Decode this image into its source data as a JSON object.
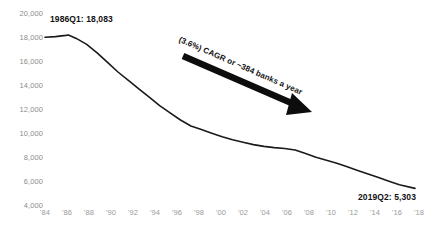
{
  "chart_data": {
    "type": "line",
    "title": "",
    "subtitle": "",
    "xlabel": "",
    "ylabel": "",
    "grid": false,
    "legend": "none",
    "ylim": [
      4000,
      20000
    ],
    "ytick_labels": [
      "20,000",
      "18,000",
      "16,000",
      "14,000",
      "12,000",
      "10,000",
      "8,000",
      "6,000",
      "4,000"
    ],
    "ytick_values": [
      20000,
      18000,
      16000,
      14000,
      12000,
      10000,
      8000,
      6000,
      4000
    ],
    "xlim": [
      1984,
      2019.5
    ],
    "xtick_labels": [
      "'84",
      "'86",
      "'88",
      "'90",
      "'92",
      "'94",
      "'96",
      "'98",
      "'00",
      "'02",
      "'04",
      "'06",
      "'08",
      "'10",
      "'12",
      "'14",
      "'16",
      "'18"
    ],
    "xtick_values": [
      1984,
      1986,
      1988,
      1990,
      1992,
      1994,
      1996,
      1998,
      2000,
      2002,
      2004,
      2006,
      2008,
      2010,
      2012,
      2014,
      2016,
      2018
    ],
    "series": [
      {
        "name": "Number of US banks",
        "color": "#1a1a1a",
        "x": [
          1984,
          1985,
          1986,
          1986.25,
          1987,
          1988,
          1989,
          1990,
          1991,
          1992,
          1993,
          1994,
          1995,
          1996,
          1997,
          1998,
          1999,
          2000,
          2001,
          2002,
          2003,
          2004,
          2005,
          2006,
          2007,
          2008,
          2009,
          2010,
          2011,
          2012,
          2013,
          2014,
          2015,
          2016,
          2017,
          2018,
          2019.5
        ],
        "values": [
          17900,
          17950,
          18050,
          18083,
          17800,
          17300,
          16600,
          15800,
          15000,
          14300,
          13600,
          12900,
          12200,
          11600,
          11000,
          10500,
          10200,
          9900,
          9600,
          9350,
          9150,
          8950,
          8800,
          8700,
          8620,
          8500,
          8200,
          7900,
          7650,
          7400,
          7100,
          6800,
          6500,
          6200,
          5900,
          5600,
          5303
        ]
      }
    ],
    "annotations": [
      {
        "name": "start-callout",
        "text": "1986Q1: 18,083",
        "x": 1986.25,
        "y": 18083
      },
      {
        "name": "end-callout",
        "text": "2019Q2: 5,303",
        "x": 2019.5,
        "y": 5303
      },
      {
        "name": "cagr-arrow-label",
        "text": "(3.6%) CAGR or ~384 banks a year",
        "arrow_from": [
          1990.2,
          16400
        ],
        "arrow_to": [
          1999.5,
          12000
        ]
      }
    ]
  },
  "axis": {
    "y_ticks": [
      {
        "label": "20,000",
        "top": 9
      },
      {
        "label": "18,000",
        "top": 33
      },
      {
        "label": "16,000",
        "top": 57
      },
      {
        "label": "14,000",
        "top": 81
      },
      {
        "label": "12,000",
        "top": 105
      },
      {
        "label": "10,000",
        "top": 129
      },
      {
        "label": "8,000",
        "top": 153
      },
      {
        "label": "6,000",
        "top": 177
      },
      {
        "label": "4,000",
        "top": 201
      }
    ],
    "x_ticks": [
      {
        "label": "'84",
        "left": 36
      },
      {
        "label": "'86",
        "left": 58
      },
      {
        "label": "'88",
        "left": 80
      },
      {
        "label": "'90",
        "left": 102
      },
      {
        "label": "'92",
        "left": 124
      },
      {
        "label": "'94",
        "left": 146
      },
      {
        "label": "'96",
        "left": 168
      },
      {
        "label": "'98",
        "left": 190
      },
      {
        "label": "'00",
        "left": 212
      },
      {
        "label": "'02",
        "left": 234
      },
      {
        "label": "'04",
        "left": 256
      },
      {
        "label": "'06",
        "left": 278
      },
      {
        "label": "'08",
        "left": 300
      },
      {
        "label": "'10",
        "left": 322
      },
      {
        "label": "'12",
        "left": 344
      },
      {
        "label": "'14",
        "left": 366
      },
      {
        "label": "'16",
        "left": 388
      },
      {
        "label": "'18",
        "left": 410
      }
    ]
  },
  "colors": {
    "line": "#1a1a1a",
    "arrow": "#0d0d0d",
    "axis_text": "#8c8c8c",
    "callout_text": "#111111",
    "background": "#ffffff"
  }
}
